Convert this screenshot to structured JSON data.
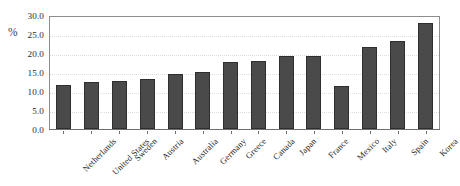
{
  "chart_data": {
    "type": "bar",
    "title": "",
    "xlabel": "",
    "ylabel": "%",
    "ylim": [
      0.0,
      30.0
    ],
    "ytick_step": 5.0,
    "ytick_labels": [
      "0.0",
      "5.0",
      "10.0",
      "15.0",
      "20.0",
      "25.0",
      "30.0"
    ],
    "ytick_values": [
      0.0,
      5.0,
      10.0,
      15.0,
      20.0,
      25.0,
      30.0
    ],
    "grid": true,
    "grid_axis": "y",
    "legend": false,
    "legend_position": "none",
    "orientation": "vertical",
    "categories": [
      "Netherlands",
      "United States",
      "Sweden",
      "Austria",
      "Australia",
      "Germany",
      "Greece",
      "Canada",
      "Japan",
      "France",
      "Mexico",
      "Italy",
      "Spain",
      "Korea"
    ],
    "values": [
      11.6,
      12.5,
      12.6,
      13.2,
      14.6,
      14.9,
      17.6,
      17.9,
      19.2,
      19.2,
      11.3,
      21.7,
      23.2,
      27.9
    ],
    "series": [
      {
        "name": "",
        "values": [
          11.6,
          12.5,
          12.6,
          13.2,
          14.6,
          14.9,
          17.6,
          17.9,
          19.2,
          19.2,
          11.3,
          21.7,
          23.2,
          27.9
        ]
      }
    ],
    "annotations": []
  },
  "colors": {
    "bar_fill": "#4a4a4a",
    "bar_edge": "#2e2e2e",
    "plot_background": "#ffffff",
    "plot_border": "#8d8d8d",
    "gridline": "#dcdcdc",
    "axis_line": "#6f6f6f",
    "tick_text": "#2b2b2b",
    "category_text": "#242424"
  }
}
